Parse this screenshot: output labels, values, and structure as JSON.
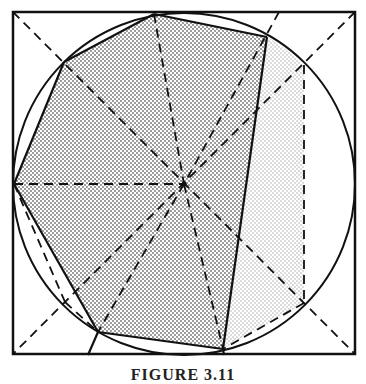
{
  "figure": {
    "colors": {
      "stroke": "#111111",
      "background": "#ffffff",
      "dark_stipple": "#6e6e6e",
      "light_stipple": "#a8a8a8"
    },
    "square": {
      "x": 13,
      "y": 12,
      "size": 342
    },
    "circle": {
      "cx": 184,
      "cy": 184,
      "r": 171
    },
    "center": {
      "x": 184,
      "y": 184
    },
    "polygon_vertices": [
      {
        "label": "top",
        "x": 154,
        "y": 14
      },
      {
        "label": "upper-right",
        "x": 267,
        "y": 37
      },
      {
        "label": "lower-right",
        "x": 223,
        "y": 349
      },
      {
        "label": "bottom-left",
        "x": 98,
        "y": 332
      },
      {
        "label": "left",
        "x": 14,
        "y": 184
      },
      {
        "label": "upper-left",
        "x": 64,
        "y": 62
      }
    ],
    "extra_points": [
      {
        "label": "circle-upper-right",
        "x": 304,
        "y": 65
      },
      {
        "label": "circle-lower-right",
        "x": 303,
        "y": 303
      },
      {
        "label": "circle-lower-left",
        "x": 65,
        "y": 302
      }
    ]
  },
  "caption": {
    "text": "FIGURE 3.11",
    "note": "caption truncated at bottom edge"
  }
}
